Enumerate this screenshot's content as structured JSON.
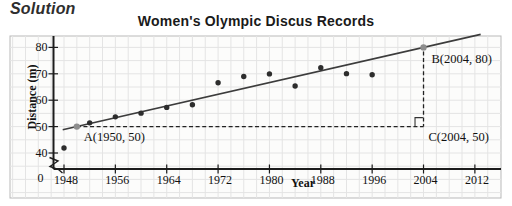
{
  "page": {
    "heading": "Solution"
  },
  "chart_data": {
    "type": "scatter",
    "title": "Women's Olympic Discus Records",
    "xlabel": "Year",
    "ylabel": "Distance (m)",
    "x_ticks": [
      1948,
      1956,
      1964,
      1972,
      1980,
      1988,
      1996,
      2004,
      2012
    ],
    "y_ticks": [
      40,
      50,
      60,
      70,
      80
    ],
    "origin_label": "0",
    "x_grid_step_years": 2,
    "y_grid_step_m": 5,
    "grid": true,
    "axis_break_y": true,
    "legend": "none",
    "points": [
      {
        "x": 1948,
        "y": 41.92
      },
      {
        "x": 1952,
        "y": 51.42
      },
      {
        "x": 1956,
        "y": 53.69
      },
      {
        "x": 1960,
        "y": 55.1
      },
      {
        "x": 1964,
        "y": 57.27
      },
      {
        "x": 1968,
        "y": 58.28
      },
      {
        "x": 1972,
        "y": 66.62
      },
      {
        "x": 1976,
        "y": 69.0
      },
      {
        "x": 1980,
        "y": 69.96
      },
      {
        "x": 1984,
        "y": 65.36
      },
      {
        "x": 1988,
        "y": 72.3
      },
      {
        "x": 1992,
        "y": 70.06
      },
      {
        "x": 1996,
        "y": 69.66
      }
    ],
    "trend_line": {
      "through": [
        {
          "x": 1950,
          "y": 50
        },
        {
          "x": 2004,
          "y": 80
        }
      ],
      "extend_x": [
        1947.8,
        2012.9
      ],
      "slope_m_per_year": 0.5556
    },
    "annotations": [
      {
        "name": "A",
        "label": "A(1950, 50)",
        "x": 1950,
        "y": 50
      },
      {
        "name": "B",
        "label": "B(2004, 80)",
        "x": 2004,
        "y": 80
      },
      {
        "name": "C",
        "label": "C(2004, 50)",
        "x": 2004,
        "y": 50
      }
    ],
    "helper_lines": {
      "horizontal": {
        "from": "A",
        "to": "C",
        "style": "dashed"
      },
      "vertical": {
        "from": "B",
        "to": "C",
        "style": "dashed"
      },
      "right_angle_marker_at": "C"
    },
    "colors": {
      "point": "#2d2d2d",
      "highlight_point": "#8e8e8e",
      "trend": "#3c3c3c",
      "dashed": "#222222",
      "grid": "#e4e4e4",
      "axis": "#1c1c1c",
      "panel_bg": "#fcfcfb",
      "panel_border": "#b9b9b9",
      "text": "#111111"
    }
  }
}
